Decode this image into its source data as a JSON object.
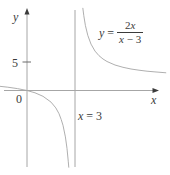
{
  "figure": {
    "background": "#ffffff",
    "line_color": "#a6a6a6",
    "text_color": "#3b3b3b",
    "y_axis_label": "y",
    "x_axis_label": "x",
    "y_tick_label": "5",
    "origin_label": "0",
    "asymptote_label": {
      "var": "x",
      "rest": " = 3"
    },
    "equation": {
      "lhs_var": "y",
      "equals": "=",
      "num_coeff": "2",
      "num_var": "x",
      "den_var": "x",
      "den_rest": " − 3"
    }
  },
  "chart_data": {
    "type": "line",
    "title": "",
    "xlabel": "x",
    "ylabel": "y",
    "function": "y = 2x/(x-3)",
    "asymptotes": {
      "vertical_x": 3,
      "horizontal_y": 2
    },
    "y_ticks": [
      5
    ],
    "x_range_shown": [
      -1.7,
      8.7
    ],
    "y_range_shown": [
      -13.3,
      14.3
    ],
    "grid": false,
    "legend": "none",
    "pixel_mapping": {
      "origin_px": [
        27,
        90.5
      ],
      "px_per_unit_x": 16,
      "px_per_unit_y": 5.8
    },
    "series": [
      {
        "name": "left-branch",
        "points": [
          [
            -1.7,
            0.72
          ],
          [
            -1.2,
            0.57
          ],
          [
            -0.6,
            0.33
          ],
          [
            0,
            0
          ],
          [
            0.5,
            -0.4
          ],
          [
            1,
            -1
          ],
          [
            1.5,
            -2
          ],
          [
            1.8,
            -3
          ],
          [
            2,
            -4
          ],
          [
            2.14,
            -5
          ],
          [
            2.25,
            -6
          ],
          [
            2.4,
            -8
          ],
          [
            2.5,
            -10
          ],
          [
            2.58,
            -12.3
          ],
          [
            2.61,
            -13.3
          ]
        ]
      },
      {
        "name": "right-branch",
        "points": [
          [
            3.49,
            14.25
          ],
          [
            3.55,
            12.9
          ],
          [
            3.65,
            11.2
          ],
          [
            3.8,
            9.5
          ],
          [
            4,
            8
          ],
          [
            4.25,
            6.8
          ],
          [
            4.5,
            6
          ],
          [
            4.75,
            5.43
          ],
          [
            5,
            5
          ],
          [
            5.5,
            4.4
          ],
          [
            6,
            4
          ],
          [
            6.5,
            3.71
          ],
          [
            7,
            3.5
          ],
          [
            7.5,
            3.33
          ],
          [
            8,
            3.2
          ],
          [
            8.7,
            3.05
          ]
        ]
      }
    ]
  }
}
